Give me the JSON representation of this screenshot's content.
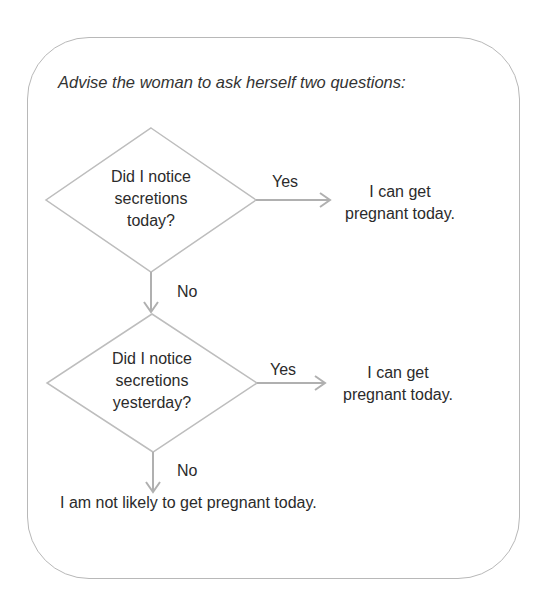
{
  "diagram": {
    "title": "Advise the woman to ask herself two questions:",
    "decisions": [
      {
        "lines": [
          "Did I notice",
          "secretions",
          "today?"
        ],
        "yes_label": "Yes",
        "yes_outcome": [
          "I can get",
          "pregnant today."
        ],
        "no_label": "No"
      },
      {
        "lines": [
          "Did I notice",
          "secretions",
          "yesterday?"
        ],
        "yes_label": "Yes",
        "yes_outcome": [
          "I can get",
          "pregnant today."
        ],
        "no_label": "No"
      }
    ],
    "final_outcome": "I am not likely to get pregnant today.",
    "colors": {
      "border": "#b8b8b8",
      "arrow": "#b0b0b0",
      "text": "#2b2b2b"
    }
  }
}
